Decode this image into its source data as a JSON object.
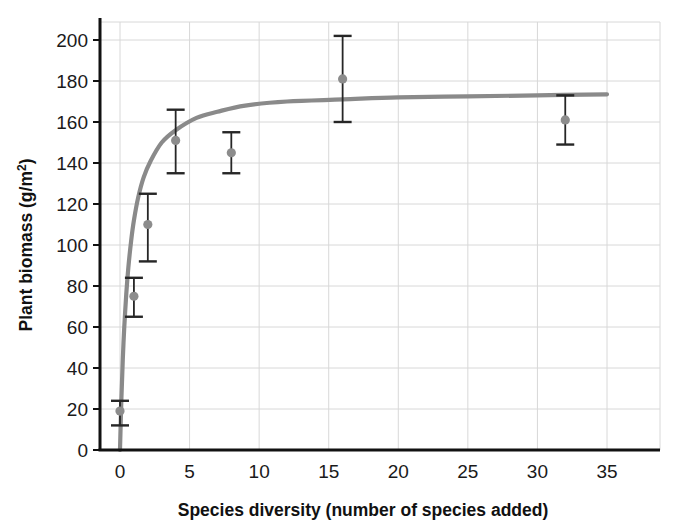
{
  "chart_data": {
    "type": "scatter",
    "title": "",
    "xlabel": "Species diversity (number of species added)",
    "ylabel_prefix": "Plant biomass (g/m",
    "ylabel_sup": "2",
    "ylabel_suffix": ")",
    "ylabel_full": "Plant biomass (g/m2)",
    "xlim": [
      0,
      35
    ],
    "ylim": [
      0,
      210
    ],
    "xticks": [
      0,
      5,
      10,
      15,
      20,
      25,
      30,
      35
    ],
    "xtick_labels": [
      "0",
      "5",
      "10",
      "15",
      "20",
      "25",
      "30",
      "35"
    ],
    "yticks": [
      0,
      20,
      40,
      60,
      80,
      100,
      120,
      140,
      160,
      180,
      200
    ],
    "ytick_labels": [
      "0",
      "20",
      "40",
      "60",
      "80",
      "100",
      "120",
      "140",
      "160",
      "180",
      "200"
    ],
    "grid": true,
    "legend": "none",
    "marker_color": "#8c8c8c",
    "errorbar_color": "#262626",
    "curve_color": "#8a8a8a",
    "grid_color": "#d8d8d8",
    "axis_color": "#111111",
    "points": [
      {
        "x": 0,
        "y": 19,
        "err_low": 12,
        "err_high": 24
      },
      {
        "x": 1,
        "y": 75,
        "err_low": 65,
        "err_high": 84
      },
      {
        "x": 2,
        "y": 110,
        "err_low": 92,
        "err_high": 125
      },
      {
        "x": 4,
        "y": 151,
        "err_low": 135,
        "err_high": 166
      },
      {
        "x": 8,
        "y": 145,
        "err_low": 135,
        "err_high": 155
      },
      {
        "x": 16,
        "y": 181,
        "err_low": 160,
        "err_high": 202
      },
      {
        "x": 32,
        "y": 161,
        "err_low": 149,
        "err_high": 173
      }
    ],
    "fit_curve": {
      "model": "saturating",
      "description": "Michaelis-Menten style saturating fit rising steeply from 0 then plateauing near 173",
      "asymptote": 181,
      "half_saturation": 0.62,
      "samples": [
        {
          "x": 0.0,
          "y": 0
        },
        {
          "x": 0.1,
          "y": 25
        },
        {
          "x": 0.2,
          "y": 44
        },
        {
          "x": 0.3,
          "y": 59
        },
        {
          "x": 0.45,
          "y": 76
        },
        {
          "x": 0.6,
          "y": 89
        },
        {
          "x": 0.8,
          "y": 102
        },
        {
          "x": 1.0,
          "y": 112
        },
        {
          "x": 1.3,
          "y": 123
        },
        {
          "x": 1.7,
          "y": 133
        },
        {
          "x": 2.2,
          "y": 141
        },
        {
          "x": 3.0,
          "y": 150
        },
        {
          "x": 4.0,
          "y": 156
        },
        {
          "x": 5.5,
          "y": 162
        },
        {
          "x": 7.0,
          "y": 165
        },
        {
          "x": 9.0,
          "y": 168
        },
        {
          "x": 12.0,
          "y": 170
        },
        {
          "x": 16.0,
          "y": 171
        },
        {
          "x": 20.0,
          "y": 172
        },
        {
          "x": 25.0,
          "y": 172.5
        },
        {
          "x": 30.0,
          "y": 173
        },
        {
          "x": 35.0,
          "y": 173.5
        }
      ]
    }
  },
  "axes": {
    "x_title": "Species diversity (number of species added)",
    "y_title": "Plant biomass (g/m2)"
  }
}
